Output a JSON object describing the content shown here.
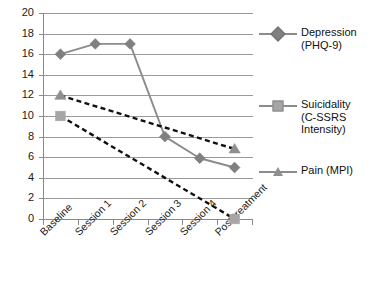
{
  "chart_data": {
    "type": "line",
    "title": "",
    "xlabel": "",
    "ylabel": "",
    "categories": [
      "Baseline",
      "Session 1",
      "Session 2",
      "Session 3",
      "Session 4",
      "Post treatment"
    ],
    "ylim": [
      0,
      20
    ],
    "ytick_step": 2,
    "yticks": [
      "0",
      "2",
      "4",
      "6",
      "8",
      "10",
      "12",
      "14",
      "16",
      "18",
      "20"
    ],
    "grid": true,
    "legend_position": "right",
    "series": [
      {
        "name": "Depression (PHQ-9)",
        "legend_label": "Depression\n(PHQ-9)",
        "marker": "diamond",
        "line_style": "solid",
        "line_color": "#8c8c8c",
        "marker_color": "#808080",
        "values": [
          16,
          17,
          17,
          8,
          5.9,
          5
        ]
      },
      {
        "name": "Suicidality (C-SSRS Intensity)",
        "legend_label": "Suicidality\n(C-SSRS\nIntensity)",
        "marker": "square",
        "line_style": "dashed",
        "line_color": "#111111",
        "marker_color": "#a6a6a6",
        "values": [
          10,
          null,
          null,
          null,
          null,
          0
        ]
      },
      {
        "name": "Pain (MPI)",
        "legend_label": "Pain (MPI)",
        "marker": "triangle",
        "line_style": "dashed",
        "line_color": "#111111",
        "marker_color": "#8f8f8f",
        "values": [
          12,
          null,
          null,
          null,
          null,
          6.8
        ]
      }
    ]
  },
  "colors": {
    "grid": "#9a9a9a",
    "axis": "#8a8a8a",
    "text": "#1a1a1a",
    "dashed_series": "#111111",
    "solid_series": "#8c8c8c",
    "background": "#ffffff"
  }
}
